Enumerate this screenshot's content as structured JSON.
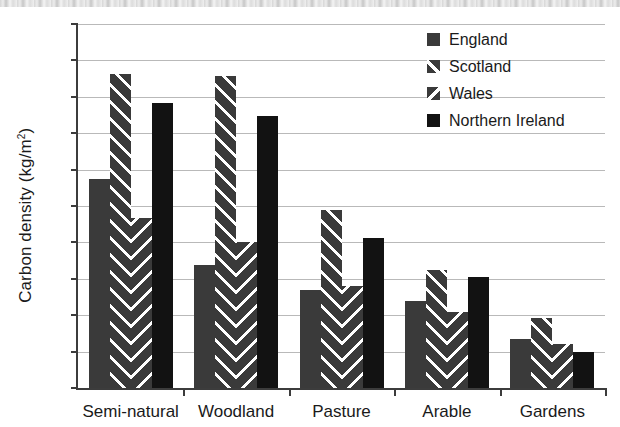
{
  "chart_data": {
    "type": "bar",
    "title": "",
    "xlabel": "",
    "ylabel": "Carbon density (kg/m",
    "ylabel_sup": "2",
    "ylabel_suffix": ")",
    "ylim": [
      0,
      50
    ],
    "ytick_step": 5,
    "grid": true,
    "legend_position": "top-right",
    "categories": [
      "Semi-natural",
      "Woodland",
      "Pasture",
      "Arable",
      "Gardens"
    ],
    "yticks": [
      "0",
      "5",
      "10",
      "15",
      "20",
      "25",
      "30",
      "35",
      "40",
      "45",
      "50"
    ],
    "series": [
      {
        "name": "England",
        "pattern": "solid-gray",
        "color": "#3a3a3a",
        "values": [
          28.7,
          16.9,
          13.4,
          12.0,
          6.7
        ]
      },
      {
        "name": "Scotland",
        "pattern": "diagonal-up",
        "color": "#3a3a3a",
        "values": [
          43.1,
          42.8,
          24.5,
          16.2,
          9.6
        ]
      },
      {
        "name": "Wales",
        "pattern": "diagonal-down",
        "color": "#3a3a3a",
        "values": [
          23.3,
          20.1,
          14.0,
          10.5,
          6.0
        ]
      },
      {
        "name": "Northern Ireland",
        "pattern": "solid-black",
        "color": "#121212",
        "values": [
          39.1,
          37.3,
          20.6,
          15.2,
          5.0
        ]
      }
    ]
  },
  "legend": {
    "items": [
      {
        "label": "England"
      },
      {
        "label": "Scotland"
      },
      {
        "label": "Wales"
      },
      {
        "label": "Northern Ireland"
      }
    ]
  }
}
